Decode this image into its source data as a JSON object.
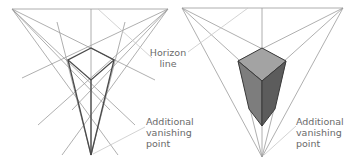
{
  "diagram": {
    "left_panel": {
      "description": "Wireframe box in three-point perspective",
      "vanishing_points": [
        {
          "x": 12,
          "y": 9
        },
        {
          "x": 168,
          "y": 9
        },
        {
          "x": 91,
          "y": 155
        }
      ],
      "box_top": [
        {
          "x": 91,
          "y": 48
        },
        {
          "x": 68,
          "y": 60
        },
        {
          "x": 91,
          "y": 80
        },
        {
          "x": 114,
          "y": 60
        }
      ]
    },
    "right_panel": {
      "description": "Shaded solid box in three-point perspective",
      "vanishing_points": [
        {
          "x": 182,
          "y": 8
        },
        {
          "x": 343,
          "y": 8
        },
        {
          "x": 262,
          "y": 157
        }
      ],
      "box_top": [
        {
          "x": 262,
          "y": 48
        },
        {
          "x": 238,
          "y": 61
        },
        {
          "x": 262,
          "y": 81
        },
        {
          "x": 286,
          "y": 61
        }
      ],
      "box_bottom": {
        "x": 262,
        "y": 126
      },
      "colors": {
        "top": "#a3a3a3",
        "left": "#7d7d7d",
        "right": "#5c5c5c"
      }
    },
    "labels": {
      "horizon_line_1": "Horizon",
      "horizon_line_2": "line",
      "additional_vp_left_1": "Additional",
      "additional_vp_left_2": "vanishing",
      "additional_vp_left_3": "point",
      "additional_vp_right_1": "Additional",
      "additional_vp_right_2": "vanishing",
      "additional_vp_right_3": "point"
    }
  }
}
